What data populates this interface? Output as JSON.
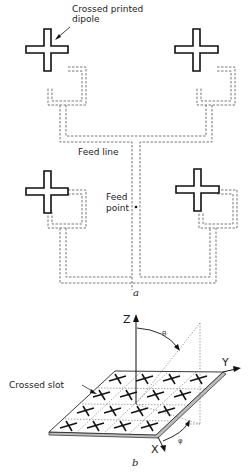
{
  "figure_a": {
    "caption": "a",
    "labels": {
      "dipole_line1": "Crossed printed",
      "dipole_line2": "dipole",
      "feed_line": "Feed line",
      "feed_point_line1": "Feed",
      "feed_point_line2": "point"
    },
    "elements": [
      {
        "name": "crossed-dipole-top-left"
      },
      {
        "name": "crossed-dipole-top-right"
      },
      {
        "name": "crossed-dipole-bottom-left"
      },
      {
        "name": "crossed-dipole-bottom-right"
      }
    ]
  },
  "figure_b": {
    "caption": "b",
    "labels": {
      "crossed_slot": "Crossed slot",
      "axis_z": "Z",
      "axis_y": "Y",
      "axis_x": "X",
      "theta": "θ",
      "phi": "φ"
    },
    "grid": {
      "rows": 4,
      "cols": 4
    }
  }
}
